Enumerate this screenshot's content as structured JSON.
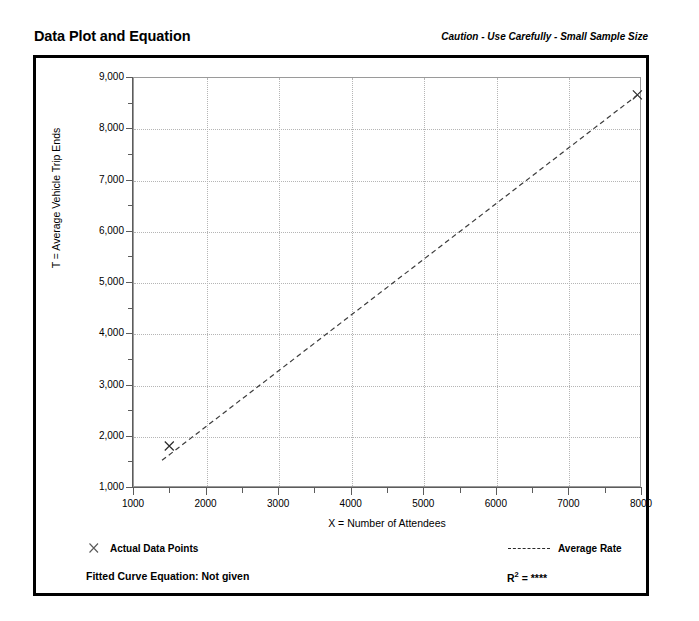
{
  "header": {
    "title": "Data Plot and Equation",
    "caution": "Caution - Use Carefully - Small Sample Size"
  },
  "legend": {
    "actual_label": "Actual Data Points",
    "average_label": "Average Rate"
  },
  "footer": {
    "fitted_equation": "Fitted Curve Equation:  Not given",
    "r_squared_prefix": "R",
    "r_squared_exp": "2",
    "r_squared_value": " = ****"
  },
  "chart_data": {
    "type": "scatter",
    "title": "Data Plot and Equation",
    "xlabel": "X = Number of Attendees",
    "ylabel": "T = Average Vehicle Trip Ends",
    "xlim": [
      1000,
      8000
    ],
    "ylim": [
      1000,
      9000
    ],
    "grid": true,
    "x_ticks": [
      1000,
      2000,
      3000,
      4000,
      5000,
      6000,
      7000,
      8000
    ],
    "x_tick_labels": [
      "1000",
      "2000",
      "3000",
      "4000",
      "5000",
      "6000",
      "7000",
      "8000"
    ],
    "x_minor_ticks": [
      1500,
      2500,
      3500,
      4500,
      5500,
      6500,
      7500
    ],
    "y_ticks": [
      1000,
      2000,
      3000,
      4000,
      5000,
      6000,
      7000,
      8000,
      9000
    ],
    "y_tick_labels": [
      "1,000",
      "2,000",
      "3,000",
      "4,000",
      "5,000",
      "6,000",
      "7,000",
      "8,000",
      "9,000"
    ],
    "y_minor_ticks": [
      1500,
      2500,
      3500,
      4500,
      5500,
      6500,
      7500,
      8500
    ],
    "series": [
      {
        "name": "Actual Data Points",
        "type": "scatter",
        "marker": "x",
        "points": [
          {
            "x": 1500,
            "y": 1800
          },
          {
            "x": 7950,
            "y": 8650
          }
        ]
      },
      {
        "name": "Average Rate",
        "type": "line",
        "style": "dashed",
        "points": [
          {
            "x": 1400,
            "y": 1520
          },
          {
            "x": 7980,
            "y": 8680
          }
        ]
      }
    ]
  }
}
